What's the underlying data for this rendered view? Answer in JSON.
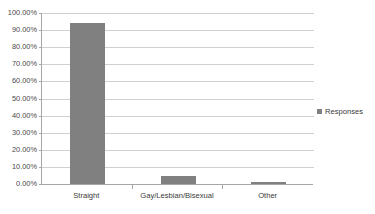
{
  "chart_data": {
    "type": "bar",
    "title": "",
    "xlabel": "",
    "ylabel": "",
    "categories": [
      "Straight",
      "Gay/Lesbian/Bisexual",
      "Other"
    ],
    "values": [
      94.0,
      4.5,
      1.0
    ],
    "series": [
      {
        "name": "Responses",
        "values": [
          94.0,
          4.5,
          1.0
        ],
        "color": "#808080"
      }
    ],
    "ylim": [
      0,
      100
    ],
    "ytick_values": [
      0,
      10,
      20,
      30,
      40,
      50,
      60,
      70,
      80,
      90,
      100
    ],
    "ytick_labels": [
      "0.00%",
      "10.00%",
      "20.00%",
      "30.00%",
      "40.00%",
      "50.00%",
      "60.00%",
      "70.00%",
      "80.00%",
      "90.00%",
      "100.00%"
    ],
    "grid": true,
    "grid_axis": "y",
    "legend": {
      "position": "right",
      "entries": [
        {
          "label": "Responses",
          "color": "#808080",
          "marker": "square"
        }
      ]
    },
    "colors": {
      "bar": "#808080",
      "gridline": "#d0d0d0",
      "axis": "#a6a6a6",
      "text": "#3a3a3a",
      "background": "#ffffff"
    }
  }
}
